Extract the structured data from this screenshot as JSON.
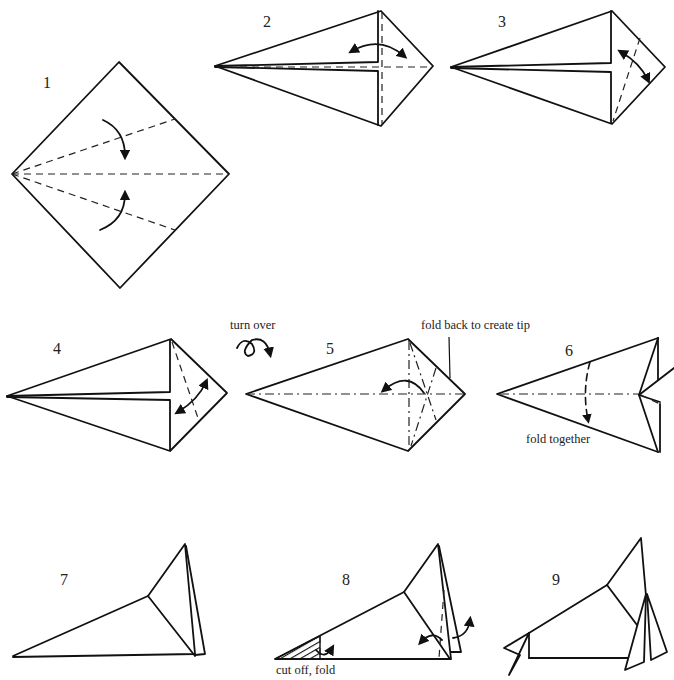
{
  "diagram": {
    "type": "origami-folding-instructions",
    "steps": [
      {
        "number": "1",
        "caption": ""
      },
      {
        "number": "2",
        "caption": ""
      },
      {
        "number": "3",
        "caption": ""
      },
      {
        "number": "4",
        "caption": ""
      },
      {
        "number": "5",
        "caption": "fold back to create tip",
        "pre_caption": "turn over"
      },
      {
        "number": "6",
        "caption": "fold together"
      },
      {
        "number": "7",
        "caption": ""
      },
      {
        "number": "8",
        "caption": "cut off, fold"
      },
      {
        "number": "9",
        "caption": ""
      }
    ],
    "colors": {
      "line": "#111111",
      "background": "#ffffff"
    }
  }
}
